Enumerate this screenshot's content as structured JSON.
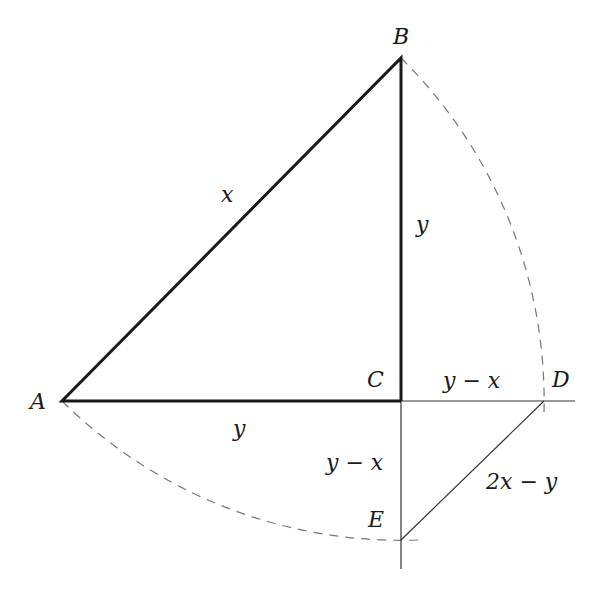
{
  "diagram": {
    "title": "",
    "points": {
      "A": {
        "label": "A",
        "x": 62,
        "y": 401
      },
      "B": {
        "label": "B",
        "x": 401,
        "y": 58
      },
      "C": {
        "label": "C",
        "x": 401,
        "y": 401
      },
      "D": {
        "label": "D",
        "x": 544,
        "y": 401
      },
      "E": {
        "label": "E",
        "x": 401,
        "y": 540
      }
    },
    "segments": {
      "AB": {
        "label": "x",
        "style": "thick"
      },
      "BC": {
        "label": "y",
        "style": "thick"
      },
      "AC": {
        "label": "y",
        "style": "thick"
      },
      "CD": {
        "label": "y − x",
        "style": "thin"
      },
      "CE": {
        "label": "y − x",
        "style": "thin"
      },
      "DE": {
        "label": "2x − y",
        "style": "thin"
      }
    },
    "arcs": [
      {
        "from": "B",
        "to": "D",
        "center": "A",
        "style": "dashed"
      },
      {
        "from": "A",
        "to": "E",
        "center": "B",
        "style": "dashed"
      }
    ],
    "colors": {
      "thick_line": "#1a1a1a",
      "thin_line": "#333333",
      "dashed_arc": "#777777",
      "background": "#ffffff"
    }
  }
}
